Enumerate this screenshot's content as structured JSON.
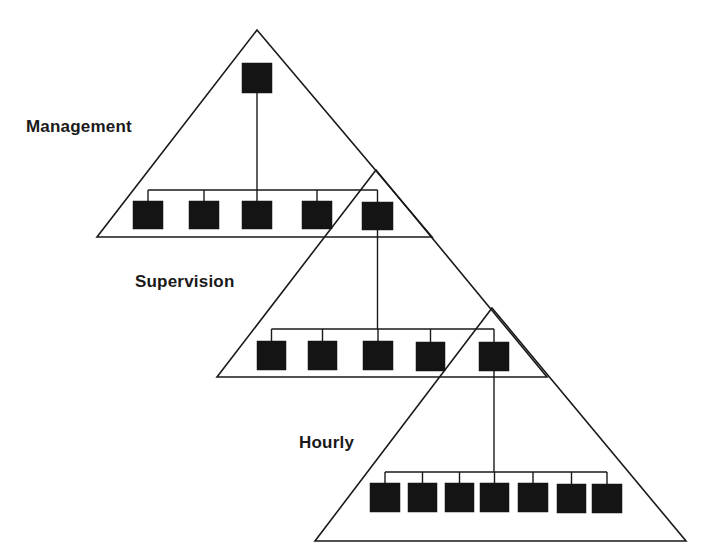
{
  "diagram": {
    "type": "hierarchical-org-pyramids",
    "stroke_color": "#1a1a1a",
    "box_color": "#141414",
    "tiers": [
      {
        "id": "management",
        "label": "Management",
        "label_pos": {
          "x": 26,
          "y": 117
        },
        "triangle": {
          "apex": [
            257,
            30
          ],
          "left": [
            97,
            237
          ],
          "right": [
            432,
            237
          ]
        },
        "top_box": {
          "x": 242,
          "y": 63,
          "w": 30,
          "h": 30
        },
        "bus_y": 190,
        "row_boxes": [
          {
            "x": 133,
            "y": 201,
            "w": 30,
            "h": 28
          },
          {
            "x": 189,
            "y": 201,
            "w": 30,
            "h": 28
          },
          {
            "x": 242,
            "y": 201,
            "w": 30,
            "h": 28
          },
          {
            "x": 302,
            "y": 201,
            "w": 30,
            "h": 28
          },
          {
            "x": 362,
            "y": 202,
            "w": 31,
            "h": 28
          }
        ]
      },
      {
        "id": "supervision",
        "label": "Supervision",
        "label_pos": {
          "x": 135,
          "y": 272
        },
        "triangle": {
          "apex": [
            376,
            170
          ],
          "left": [
            217,
            377
          ],
          "right": [
            547,
            377
          ]
        },
        "top_box": null,
        "bus_y": 329,
        "row_boxes": [
          {
            "x": 257,
            "y": 341,
            "w": 29,
            "h": 29
          },
          {
            "x": 308,
            "y": 341,
            "w": 29,
            "h": 29
          },
          {
            "x": 363,
            "y": 341,
            "w": 30,
            "h": 29
          },
          {
            "x": 416,
            "y": 342,
            "w": 29,
            "h": 29
          },
          {
            "x": 479,
            "y": 342,
            "w": 30,
            "h": 29
          }
        ]
      },
      {
        "id": "hourly",
        "label": "Hourly",
        "label_pos": {
          "x": 299,
          "y": 433
        },
        "triangle": {
          "apex": [
            492,
            308
          ],
          "left": [
            315,
            541
          ],
          "right": [
            686,
            541
          ]
        },
        "top_box": null,
        "bus_y": 472,
        "row_boxes": [
          {
            "x": 370,
            "y": 483,
            "w": 30,
            "h": 29
          },
          {
            "x": 408,
            "y": 483,
            "w": 29,
            "h": 29
          },
          {
            "x": 445,
            "y": 483,
            "w": 29,
            "h": 29
          },
          {
            "x": 480,
            "y": 483,
            "w": 29,
            "h": 29
          },
          {
            "x": 518,
            "y": 483,
            "w": 30,
            "h": 29
          },
          {
            "x": 557,
            "y": 484,
            "w": 29,
            "h": 29
          },
          {
            "x": 592,
            "y": 484,
            "w": 30,
            "h": 29
          }
        ]
      }
    ],
    "links": [
      {
        "from_tier": "management",
        "from": "top_box",
        "to_box_index": 2
      },
      {
        "from_tier": "management",
        "from_box_index": 4,
        "to_tier": "supervision",
        "to_box_index": 2
      },
      {
        "from_tier": "supervision",
        "from_box_index": 4,
        "to_tier": "hourly",
        "to_box_index": 3
      }
    ]
  }
}
